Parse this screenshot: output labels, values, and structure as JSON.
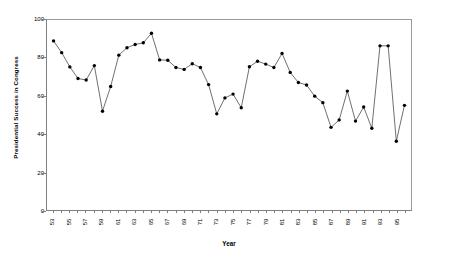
{
  "chart_data": {
    "type": "line",
    "title": "",
    "xlabel": "Year",
    "ylabel": "Presidential Success in Congress",
    "xlim": [
      52.2,
      96.8
    ],
    "ylim": [
      0,
      100
    ],
    "grid": false,
    "legend": null,
    "marker": "filled-circle",
    "line_color": "#4a4a4a",
    "marker_color": "#000000",
    "ytick_labels": [
      "0",
      "20",
      "40",
      "60",
      "80",
      "100"
    ],
    "ytick_values": [
      0,
      20,
      40,
      60,
      80,
      100
    ],
    "xtick_labels": [
      "53",
      "55",
      "57",
      "59",
      "61",
      "63",
      "65",
      "67",
      "69",
      "71",
      "73",
      "75",
      "77",
      "79",
      "81",
      "83",
      "85",
      "87",
      "89",
      "91",
      "93",
      "95"
    ],
    "xtick_values": [
      53,
      55,
      57,
      59,
      61,
      63,
      65,
      67,
      69,
      71,
      73,
      75,
      77,
      79,
      81,
      83,
      85,
      87,
      89,
      91,
      93,
      95
    ],
    "x": [
      53,
      54,
      55,
      56,
      57,
      58,
      59,
      60,
      61,
      62,
      63,
      64,
      65,
      66,
      67,
      68,
      69,
      70,
      71,
      72,
      73,
      74,
      75,
      76,
      77,
      78,
      79,
      80,
      81,
      82,
      83,
      84,
      85,
      86,
      87,
      88,
      89,
      90,
      91,
      92,
      93,
      94,
      95,
      96
    ],
    "values": [
      89.0,
      82.8,
      75.3,
      69.2,
      68.4,
      76.0,
      52.0,
      65.0,
      81.5,
      85.4,
      87.1,
      88.0,
      93.0,
      79.0,
      78.8,
      75.0,
      74.0,
      77.0,
      75.0,
      66.0,
      50.6,
      59.0,
      61.0,
      53.8,
      75.4,
      78.3,
      76.8,
      75.0,
      82.4,
      72.4,
      67.1,
      65.8,
      59.9,
      56.5,
      43.5,
      47.4,
      62.6,
      46.8,
      54.2,
      43.0,
      86.4,
      86.4,
      36.2,
      55.1
    ]
  }
}
